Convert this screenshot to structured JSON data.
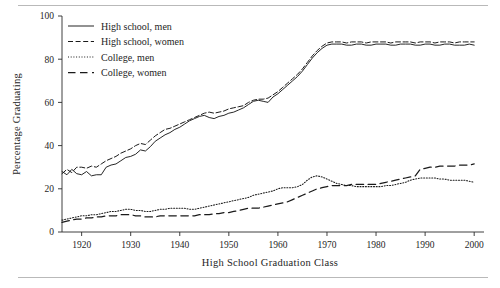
{
  "chart_data": {
    "type": "line",
    "title": "",
    "xlabel": "High School Graduation Class",
    "ylabel": "Percentage Graduating",
    "xlim": [
      1916,
      2002
    ],
    "ylim": [
      0,
      100
    ],
    "grid": false,
    "legend_position": "top-left-inside",
    "xticks": [
      1920,
      1930,
      1940,
      1950,
      1960,
      1970,
      1980,
      1990,
      2000
    ],
    "xtick_labels": [
      "1920",
      "1930",
      "1940",
      "1950",
      "1960",
      "1970",
      "1980",
      "1990",
      "2000"
    ],
    "yticks": [
      0,
      20,
      40,
      60,
      80,
      100
    ],
    "ytick_labels": [
      "0",
      "20",
      "40",
      "60",
      "80",
      "100"
    ],
    "series": [
      {
        "name": "High school, men",
        "style": "solid",
        "color": "#1a1a1a",
        "x": [
          1916,
          1917,
          1918,
          1919,
          1920,
          1921,
          1922,
          1923,
          1924,
          1925,
          1926,
          1927,
          1928,
          1929,
          1930,
          1931,
          1932,
          1933,
          1934,
          1935,
          1936,
          1937,
          1938,
          1939,
          1940,
          1941,
          1942,
          1943,
          1944,
          1945,
          1946,
          1947,
          1948,
          1949,
          1950,
          1951,
          1952,
          1953,
          1954,
          1955,
          1956,
          1957,
          1958,
          1959,
          1960,
          1961,
          1962,
          1963,
          1964,
          1965,
          1966,
          1967,
          1968,
          1969,
          1970,
          1971,
          1972,
          1973,
          1974,
          1975,
          1976,
          1977,
          1978,
          1979,
          1980,
          1981,
          1982,
          1983,
          1984,
          1985,
          1986,
          1987,
          1988,
          1989,
          1990,
          1991,
          1992,
          1993,
          1994,
          1995,
          1996,
          1997,
          1998,
          1999,
          2000
        ],
        "y": [
          28,
          26.5,
          29,
          27,
          26.5,
          28,
          26,
          26.5,
          26.5,
          30,
          31,
          31.5,
          33,
          34.5,
          35,
          36,
          38,
          37.5,
          39.5,
          42,
          43.5,
          45,
          46,
          47.5,
          48.5,
          50,
          51.5,
          52.5,
          53.5,
          54,
          53,
          52.5,
          53.5,
          54,
          55,
          55.5,
          56.5,
          57.5,
          59,
          60.5,
          61,
          60.5,
          60,
          62.5,
          64,
          66,
          68,
          70,
          72,
          74.5,
          77.5,
          80.5,
          83,
          85,
          86.5,
          87,
          87,
          87,
          86.5,
          86.5,
          87,
          87,
          86.5,
          86.5,
          87,
          87,
          87,
          86.5,
          86.5,
          87,
          87,
          87,
          86.5,
          86.5,
          87,
          87,
          86.5,
          86.5,
          87,
          87,
          86.5,
          86.5,
          86.5,
          87,
          86.5
        ]
      },
      {
        "name": "High school, women",
        "style": "dashed",
        "color": "#1a1a1a",
        "x": [
          1916,
          1917,
          1918,
          1919,
          1920,
          1921,
          1922,
          1923,
          1924,
          1925,
          1926,
          1927,
          1928,
          1929,
          1930,
          1931,
          1932,
          1933,
          1934,
          1935,
          1936,
          1937,
          1938,
          1939,
          1940,
          1941,
          1942,
          1943,
          1944,
          1945,
          1946,
          1947,
          1948,
          1949,
          1950,
          1951,
          1952,
          1953,
          1954,
          1955,
          1956,
          1957,
          1958,
          1959,
          1960,
          1961,
          1962,
          1963,
          1964,
          1965,
          1966,
          1967,
          1968,
          1969,
          1970,
          1971,
          1972,
          1973,
          1974,
          1975,
          1976,
          1977,
          1978,
          1979,
          1980,
          1981,
          1982,
          1983,
          1984,
          1985,
          1986,
          1987,
          1988,
          1989,
          1990,
          1991,
          1992,
          1993,
          1994,
          1995,
          1996,
          1997,
          1998,
          1999,
          2000
        ],
        "y": [
          27,
          29,
          27.5,
          30,
          30,
          29.5,
          30.5,
          30,
          31.5,
          33,
          34,
          35,
          36.5,
          37.5,
          38.5,
          40,
          41,
          40.5,
          42.5,
          44.5,
          46,
          47.5,
          48,
          49,
          50,
          51,
          52,
          53,
          54,
          55,
          55.5,
          55,
          55.5,
          56,
          57,
          57.5,
          58,
          58.5,
          60,
          61,
          61.5,
          61.5,
          62,
          63.5,
          65,
          67,
          69,
          71,
          73,
          75.5,
          78.5,
          81.5,
          84,
          86,
          87.5,
          88,
          88,
          88,
          87.5,
          88,
          88,
          88,
          87.5,
          88,
          88,
          88,
          88,
          87.5,
          88,
          88,
          88,
          88,
          87.5,
          88,
          88,
          88,
          87.5,
          88,
          88,
          88,
          87.5,
          88,
          88,
          88,
          88
        ]
      },
      {
        "name": "College, men",
        "style": "dotted",
        "color": "#1a1a1a",
        "x": [
          1916,
          1917,
          1918,
          1919,
          1920,
          1921,
          1922,
          1923,
          1924,
          1925,
          1926,
          1927,
          1928,
          1929,
          1930,
          1931,
          1932,
          1933,
          1934,
          1935,
          1936,
          1937,
          1938,
          1939,
          1940,
          1941,
          1942,
          1943,
          1944,
          1945,
          1946,
          1947,
          1948,
          1949,
          1950,
          1951,
          1952,
          1953,
          1954,
          1955,
          1956,
          1957,
          1958,
          1959,
          1960,
          1961,
          1962,
          1963,
          1964,
          1965,
          1966,
          1967,
          1968,
          1969,
          1970,
          1971,
          1972,
          1973,
          1974,
          1975,
          1976,
          1977,
          1978,
          1979,
          1980,
          1981,
          1982,
          1983,
          1984,
          1985,
          1986,
          1987,
          1988,
          1989,
          1990,
          1991,
          1992,
          1993,
          1994,
          1995,
          1996,
          1997,
          1998,
          1999,
          2000
        ],
        "y": [
          5.5,
          6,
          6.5,
          7,
          7.5,
          7.5,
          8,
          8,
          8.5,
          9,
          9.5,
          9.5,
          10,
          10.5,
          10.5,
          10,
          10,
          9.5,
          9.5,
          10,
          10.5,
          10.5,
          11,
          11,
          11,
          11,
          10.5,
          10.5,
          11,
          11.5,
          12,
          12.5,
          13,
          13.5,
          14,
          14.5,
          15,
          15.5,
          16,
          17,
          17.5,
          18,
          18.5,
          19,
          20,
          20.5,
          20.5,
          20.5,
          21,
          22,
          24,
          25.5,
          26,
          25.5,
          24.5,
          23.5,
          22.5,
          22,
          21.5,
          21.5,
          21,
          21,
          21,
          21,
          21,
          21,
          21.5,
          21.5,
          22,
          22.5,
          23,
          24,
          24.5,
          25,
          25,
          25,
          25,
          24.5,
          24.5,
          24,
          24,
          24,
          24,
          23.5,
          23
        ]
      },
      {
        "name": "College, women",
        "style": "longdash",
        "color": "#1a1a1a",
        "x": [
          1916,
          1917,
          1918,
          1919,
          1920,
          1921,
          1922,
          1923,
          1924,
          1925,
          1926,
          1927,
          1928,
          1929,
          1930,
          1931,
          1932,
          1933,
          1934,
          1935,
          1936,
          1937,
          1938,
          1939,
          1940,
          1941,
          1942,
          1943,
          1944,
          1945,
          1946,
          1947,
          1948,
          1949,
          1950,
          1951,
          1952,
          1953,
          1954,
          1955,
          1956,
          1957,
          1958,
          1959,
          1960,
          1961,
          1962,
          1963,
          1964,
          1965,
          1966,
          1967,
          1968,
          1969,
          1970,
          1971,
          1972,
          1973,
          1974,
          1975,
          1976,
          1977,
          1978,
          1979,
          1980,
          1981,
          1982,
          1983,
          1984,
          1985,
          1986,
          1987,
          1988,
          1989,
          1990,
          1991,
          1992,
          1993,
          1994,
          1995,
          1996,
          1997,
          1998,
          1999,
          2000
        ],
        "y": [
          4.5,
          5,
          5.5,
          6,
          6,
          6.5,
          6.5,
          7,
          7,
          7.5,
          7.5,
          7.5,
          8,
          8,
          8,
          7.5,
          7.5,
          7,
          7,
          7,
          7.5,
          7.5,
          7.5,
          7.5,
          7.5,
          7.5,
          7.5,
          7.5,
          8,
          8,
          8,
          8.5,
          8.5,
          9,
          9,
          9.5,
          10,
          10.5,
          11,
          11,
          11,
          11.5,
          12,
          12.5,
          13,
          13.5,
          14,
          15,
          16,
          17,
          18,
          19,
          20,
          20.5,
          21,
          21.5,
          21.5,
          21.5,
          21.5,
          22,
          22,
          22,
          22,
          22,
          22,
          22.5,
          23,
          23.5,
          24,
          24.5,
          25,
          25.5,
          26,
          29,
          29.5,
          30,
          30,
          30.5,
          30.5,
          30.5,
          30.5,
          31,
          31,
          31,
          31.5
        ]
      }
    ]
  },
  "legend": {
    "entries": [
      {
        "label": "High school, men",
        "style": "solid"
      },
      {
        "label": "High school, women",
        "style": "dashed"
      },
      {
        "label": "College, men",
        "style": "dotted"
      },
      {
        "label": "College, women",
        "style": "longdash"
      }
    ]
  },
  "axes": {
    "x_title": "High School Graduation Class",
    "y_title": "Percentage Graduating"
  }
}
